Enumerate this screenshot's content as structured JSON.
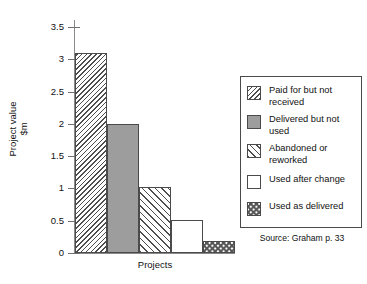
{
  "chart_data": {
    "type": "bar",
    "title": "",
    "xlabel": "Projects",
    "ylabel": "Project value\n$m",
    "ylabel_line1": "Project value",
    "ylabel_line2": "$m",
    "ylim": [
      0,
      3.5
    ],
    "ytick_values": [
      0,
      0.5,
      1,
      1.5,
      2,
      2.5,
      3,
      3.5
    ],
    "ytick_labels": [
      "0",
      "0.5",
      "1",
      "1.5",
      "2",
      "2.5",
      "3",
      "3.5"
    ],
    "xtick_labels": [],
    "grid": false,
    "categories": [
      "Paid for but not received",
      "Delivered but not used",
      "Abandoned or reworked",
      "Used after change",
      "Used as delivered"
    ],
    "values": [
      3.1,
      2.0,
      1.02,
      0.51,
      0.19
    ],
    "series": [
      {
        "name": "Project value",
        "values": [
          3.1,
          2.0,
          1.02,
          0.51,
          0.19
        ]
      }
    ],
    "patterns": [
      "dense-backward-diagonal-hatch",
      "solid-grey",
      "forward-diagonal-hatch",
      "white-empty",
      "checkerboard"
    ],
    "source_note": "Source: Graham p. 33"
  },
  "axes": {
    "y_title_line1": "Project value",
    "y_title_line2": "$m",
    "x_title": "Projects",
    "y_ticks": [
      "3.5",
      "3",
      "2.5",
      "2",
      "1.5",
      "1",
      "0.5",
      "0"
    ]
  },
  "legend": {
    "position": "right-inside",
    "items": [
      {
        "label": "Paid for but not received",
        "pattern": "dense-backward-diagonal-hatch"
      },
      {
        "label": "Delivered but not used",
        "pattern": "solid-grey"
      },
      {
        "label": "Abandoned or reworked",
        "pattern": "forward-diagonal-hatch"
      },
      {
        "label": "Used after change",
        "pattern": "white-empty"
      },
      {
        "label": "Used as delivered",
        "pattern": "checkerboard"
      }
    ],
    "source": "Source: Graham p. 33"
  },
  "colors": {
    "bar_outline": "#4a4a4a",
    "hatch": "#4d4d4d",
    "solid_grey_fill": "#9d9d9d",
    "axis": "#8a8a8a",
    "text": "#111111",
    "background": "#ffffff"
  }
}
